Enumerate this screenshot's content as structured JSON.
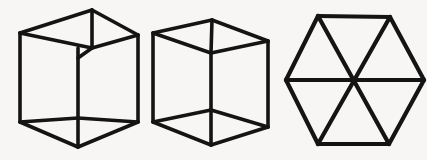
{
  "canvas": {
    "width": 427,
    "height": 160,
    "background_color": "#f7f6f4",
    "ink_color": "#141414",
    "description": "Three black line-drawn geometric figures on a light paper background: two transparent wireframe cubes (Necker cubes) and a hexagon divided into six triangles."
  },
  "figures": [
    {
      "name": "necker-cube-left",
      "label": "Transparent wireframe cube (left)",
      "shape": "cube",
      "stroke_width": 3.6,
      "outline_points": "20,33 92,10 138,35 138,122 78,147 20,122",
      "edges": [
        {
          "name": "outline-top-left",
          "points": "20,33 92,10"
        },
        {
          "name": "outline-top-right",
          "points": "92,10 138,35"
        },
        {
          "name": "outline-right",
          "points": "138,35 138,122"
        },
        {
          "name": "outline-bottom-right",
          "points": "138,122 78,147"
        },
        {
          "name": "outline-bottom-left",
          "points": "78,147 20,122"
        },
        {
          "name": "outline-left",
          "points": "20,122 20,33"
        },
        {
          "name": "inner-vertical-upper",
          "points": "92,10 92,48"
        },
        {
          "name": "inner-edge-to-left",
          "points": "92,48 20,33"
        },
        {
          "name": "inner-edge-to-right",
          "points": "92,48 138,35"
        },
        {
          "name": "inner-vertical-lower",
          "points": "78,48 78,118"
        },
        {
          "name": "inner-vertical-bridge",
          "points": "92,48 78,58"
        },
        {
          "name": "inner-bottom-to-left",
          "points": "78,118 20,122"
        },
        {
          "name": "inner-bottom-to-right",
          "points": "78,118 138,122"
        },
        {
          "name": "inner-bottom-vertical",
          "points": "78,118 78,147"
        }
      ]
    },
    {
      "name": "necker-cube-right",
      "label": "Transparent wireframe cube (right)",
      "shape": "cube",
      "stroke_width": 3.6,
      "outline_points": "153,33 212,20 268,41 268,127 211,145 153,122",
      "edges": [
        {
          "name": "outline-top-left",
          "points": "153,33 212,20"
        },
        {
          "name": "outline-top-right",
          "points": "212,20 268,41"
        },
        {
          "name": "outline-right",
          "points": "268,41 268,127"
        },
        {
          "name": "outline-bottom-right",
          "points": "268,127 211,145"
        },
        {
          "name": "outline-bottom-left",
          "points": "211,145 153,122"
        },
        {
          "name": "outline-left",
          "points": "153,122 153,33"
        },
        {
          "name": "inner-vertical-upper",
          "points": "212,20 211,53"
        },
        {
          "name": "inner-edge-to-left",
          "points": "211,53 153,33"
        },
        {
          "name": "inner-edge-to-right",
          "points": "211,53 268,41"
        },
        {
          "name": "inner-vertical-column",
          "points": "211,53 211,110"
        },
        {
          "name": "inner-bottom-to-left",
          "points": "211,110 153,122"
        },
        {
          "name": "inner-bottom-to-right",
          "points": "211,110 268,127"
        },
        {
          "name": "inner-bottom-vertical",
          "points": "211,110 211,145"
        }
      ]
    },
    {
      "name": "hexagon-six-triangles",
      "label": "Regular hexagon divided into six triangles",
      "shape": "hexagon",
      "stroke_width": 4.2,
      "center": "354,80",
      "outline_points": "318,16 390,17 424,80 389,144 318,144 286,80",
      "edges": [
        {
          "name": "outline-top",
          "points": "318,16 390,17"
        },
        {
          "name": "outline-upper-right",
          "points": "390,17 424,80"
        },
        {
          "name": "outline-lower-right",
          "points": "424,80 389,144"
        },
        {
          "name": "outline-bottom",
          "points": "389,144 318,144"
        },
        {
          "name": "outline-lower-left",
          "points": "318,144 286,80"
        },
        {
          "name": "outline-upper-left",
          "points": "286,80 318,16"
        },
        {
          "name": "diagonal-horizontal",
          "points": "286,80 424,80"
        },
        {
          "name": "diagonal-top-left-to-bottom-right",
          "points": "318,16 389,144"
        },
        {
          "name": "diagonal-top-right-to-bottom-left",
          "points": "390,17 318,144"
        }
      ]
    }
  ]
}
